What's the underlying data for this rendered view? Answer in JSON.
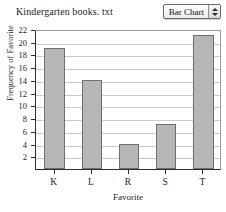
{
  "header": {
    "file_title": "Kindergarten books. txt",
    "chart_type_label": "Bar Chart",
    "stepper_up_icon": "triangle-up-icon",
    "stepper_down_icon": "triangle-down-icon"
  },
  "chart_data": {
    "type": "bar",
    "title": "Kindergarten books. txt",
    "categories": [
      "K",
      "L",
      "R",
      "S",
      "T"
    ],
    "values": [
      19,
      14,
      4,
      7,
      21
    ],
    "xlabel": "Favorite",
    "ylabel": "Frequency of Favorite",
    "ylim": [
      0,
      22
    ],
    "ytick_step": 2,
    "yticks": [
      2,
      4,
      6,
      8,
      10,
      12,
      14,
      16,
      18,
      20,
      22
    ],
    "grid": true,
    "legend": "none",
    "bar_color": "#b6b6b6",
    "bar_border_color": "#6e6e6e",
    "gridline_color": "#c9c9c9",
    "axis_color": "#2e2e2e"
  }
}
